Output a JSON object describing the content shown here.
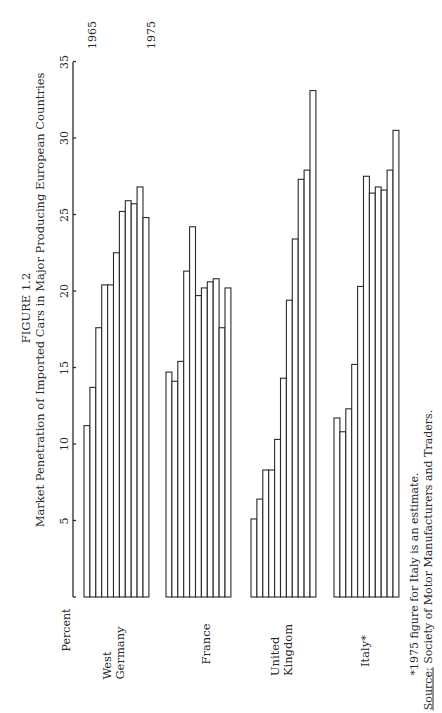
{
  "figure": {
    "number": "FIGURE 1.2",
    "title": "Market Penetration of Imported Cars in Major Producing European Countries",
    "ylabel": "Percent",
    "year_start_label": "1965",
    "year_end_label": "1975",
    "footnote": "*1975 figure for Italy is an estimate.",
    "source_label": "Source:",
    "source_text": "Society of Motor Manufacturers and Traders."
  },
  "groups": [
    {
      "label_line1": "West",
      "label_line2": "Germany"
    },
    {
      "label_line1": "France",
      "label_line2": ""
    },
    {
      "label_line1": "United",
      "label_line2": "Kingdom"
    },
    {
      "label_line1": "Italy*",
      "label_line2": ""
    }
  ],
  "ticks": [
    "5",
    "10",
    "15",
    "20",
    "25",
    "30",
    "35"
  ],
  "chart_data": {
    "type": "bar",
    "orientation": "rotated 90° (bars read as vertical in original page, page rotated)",
    "xlabel": "",
    "ylabel": "Percent",
    "ylim": [
      0,
      35
    ],
    "yticks": [
      5,
      10,
      15,
      20,
      25,
      30,
      35
    ],
    "grid": false,
    "legend": null,
    "annotations": [
      "1965 (first bar)",
      "1975 (last bar)",
      "*1975 figure for Italy is an estimate.",
      "Source: Society of Motor Manufacturers and Traders."
    ],
    "categories": [
      "1965",
      "1966",
      "1967",
      "1968",
      "1969",
      "1970",
      "1971",
      "1972",
      "1973",
      "1974",
      "1975"
    ],
    "series": [
      {
        "name": "West Germany",
        "values": [
          11.2,
          13.7,
          17.6,
          20.4,
          20.4,
          22.5,
          25.2,
          25.9,
          25.7,
          26.8,
          24.8
        ]
      },
      {
        "name": "France",
        "values": [
          14.7,
          14.1,
          15.4,
          21.3,
          24.2,
          19.7,
          20.2,
          20.6,
          20.8,
          17.6,
          20.2
        ]
      },
      {
        "name": "United Kingdom",
        "values": [
          5.1,
          6.4,
          8.3,
          8.3,
          10.3,
          14.3,
          19.4,
          23.4,
          27.3,
          27.9,
          33.1
        ]
      },
      {
        "name": "Italy*",
        "values": [
          11.7,
          10.8,
          12.3,
          15.2,
          20.3,
          27.5,
          26.4,
          26.8,
          26.6,
          27.9,
          30.5
        ]
      }
    ]
  }
}
